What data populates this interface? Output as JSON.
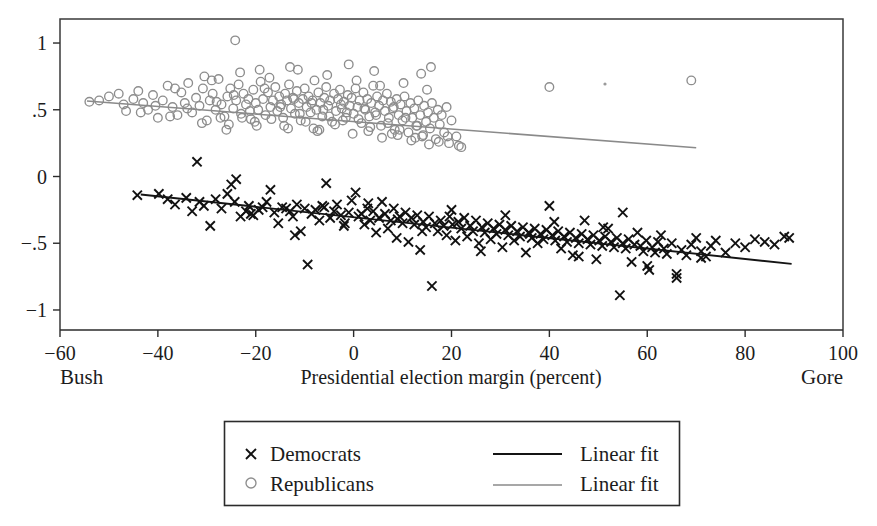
{
  "figure": {
    "background": "#ffffff",
    "plot_frame": {
      "left": 60,
      "top": 19,
      "right": 843,
      "bottom": 330
    }
  },
  "chart_data": {
    "type": "scatter",
    "title": "",
    "subtitle": "",
    "xlabel": "Presidential election margin (percent)",
    "ylabel": "",
    "xlim": [
      -60,
      100
    ],
    "ylim": [
      -1.15,
      1.18
    ],
    "xticks": [
      -60,
      -40,
      -20,
      0,
      20,
      40,
      60,
      80,
      100
    ],
    "xtick_labels": [
      "−60",
      "−40",
      "−20",
      "0",
      "20",
      "40",
      "60",
      "80",
      "100"
    ],
    "yticks": [
      -1,
      -0.5,
      0,
      0.5,
      1
    ],
    "ytick_labels": [
      "−1",
      "−.5",
      "0",
      ".5",
      "1"
    ],
    "grid": false,
    "legend_position": "below-center",
    "axis_end_labels": {
      "left": "Bush",
      "right": "Gore"
    },
    "series": [
      {
        "name": "Democrats",
        "marker": "x",
        "color": "#111111",
        "x": [
          -44.2,
          -39.8,
          -38.0,
          -36.5,
          -34.2,
          -33.0,
          -31.5,
          -30.6,
          -29.3,
          -28.2,
          -27.0,
          -25.8,
          -25.0,
          -24.3,
          -23.1,
          -22.0,
          -21.4,
          -20.5,
          -19.4,
          -18.6,
          -17.8,
          -17.0,
          -16.2,
          -15.4,
          -14.6,
          -13.8,
          -13.0,
          -12.4,
          -11.6,
          -10.8,
          -10.0,
          -9.4,
          -8.6,
          -7.8,
          -7.0,
          -6.4,
          -5.6,
          -4.8,
          -4.0,
          -3.4,
          -2.6,
          -1.8,
          -1.0,
          -0.4,
          0.4,
          1.0,
          1.6,
          2.2,
          2.8,
          3.4,
          4.0,
          4.6,
          5.2,
          5.8,
          6.4,
          7.0,
          7.6,
          8.2,
          8.8,
          9.4,
          10.0,
          10.6,
          11.2,
          11.8,
          12.4,
          13.0,
          13.6,
          14.2,
          14.8,
          15.4,
          16.0,
          16.6,
          17.2,
          17.8,
          18.4,
          19.0,
          19.6,
          20.2,
          20.8,
          21.4,
          22.0,
          22.6,
          23.2,
          23.8,
          24.4,
          25.0,
          25.6,
          26.2,
          26.8,
          27.4,
          28.0,
          28.6,
          29.2,
          29.8,
          30.4,
          31.0,
          31.6,
          32.2,
          32.8,
          33.4,
          34.0,
          34.6,
          35.2,
          35.8,
          36.4,
          37.0,
          37.6,
          38.2,
          38.8,
          39.4,
          40.0,
          40.6,
          41.2,
          41.8,
          42.4,
          43.0,
          43.6,
          44.2,
          44.8,
          45.4,
          46.0,
          46.6,
          47.2,
          47.8,
          48.4,
          49.0,
          49.6,
          50.2,
          50.8,
          51.4,
          52.0,
          52.6,
          53.2,
          53.8,
          54.4,
          55.0,
          55.6,
          56.2,
          56.8,
          57.4,
          58.0,
          58.6,
          59.2,
          59.8,
          60.4,
          61.0,
          61.6,
          62.2,
          62.8,
          63.4,
          64.0,
          65.0,
          66.0,
          67.0,
          68.0,
          69.0,
          70.0,
          71.0,
          72.0,
          73.0,
          74.0,
          76.0,
          78.0,
          80.0,
          82.0,
          84.0,
          86.0,
          88.0,
          89.0,
          -32.0,
          -24.0,
          -21.0,
          -12.0,
          -6.0,
          -2.0,
          3.0,
          9.0,
          14.0,
          20.0,
          26.0,
          31.0,
          36.0,
          41.0,
          46.0,
          51.0,
          55.0,
          60.0,
          66.0,
          71.0
        ],
        "y": [
          -0.14,
          -0.13,
          -0.17,
          -0.21,
          -0.16,
          -0.26,
          -0.19,
          -0.22,
          -0.37,
          -0.17,
          -0.24,
          -0.13,
          -0.06,
          -0.19,
          -0.3,
          -0.26,
          -0.22,
          -0.29,
          -0.25,
          -0.23,
          -0.19,
          -0.1,
          -0.27,
          -0.35,
          -0.23,
          -0.24,
          -0.26,
          -0.3,
          -0.21,
          -0.41,
          -0.24,
          -0.66,
          -0.28,
          -0.25,
          -0.33,
          -0.22,
          -0.05,
          -0.31,
          -0.26,
          -0.21,
          -0.29,
          -0.35,
          -0.27,
          -0.18,
          -0.12,
          -0.3,
          -0.28,
          -0.36,
          -0.24,
          -0.33,
          -0.26,
          -0.42,
          -0.31,
          -0.19,
          -0.28,
          -0.39,
          -0.33,
          -0.24,
          -0.46,
          -0.3,
          -0.35,
          -0.27,
          -0.49,
          -0.31,
          -0.36,
          -0.29,
          -0.55,
          -0.34,
          -0.38,
          -0.3,
          -0.82,
          -0.35,
          -0.41,
          -0.33,
          -0.37,
          -0.44,
          -0.3,
          -0.36,
          -0.48,
          -0.34,
          -0.39,
          -0.31,
          -0.45,
          -0.37,
          -0.41,
          -0.33,
          -0.5,
          -0.38,
          -0.42,
          -0.35,
          -0.47,
          -0.39,
          -0.43,
          -0.36,
          -0.53,
          -0.4,
          -0.44,
          -0.37,
          -0.48,
          -0.41,
          -0.45,
          -0.38,
          -0.57,
          -0.42,
          -0.46,
          -0.39,
          -0.5,
          -0.43,
          -0.47,
          -0.4,
          -0.22,
          -0.44,
          -0.48,
          -0.41,
          -0.54,
          -0.45,
          -0.49,
          -0.42,
          -0.59,
          -0.46,
          -0.5,
          -0.43,
          -0.33,
          -0.47,
          -0.51,
          -0.44,
          -0.62,
          -0.48,
          -0.52,
          -0.45,
          -0.39,
          -0.49,
          -0.53,
          -0.46,
          -0.89,
          -0.5,
          -0.54,
          -0.47,
          -0.64,
          -0.51,
          -0.42,
          -0.52,
          -0.56,
          -0.48,
          -0.7,
          -0.53,
          -0.57,
          -0.49,
          -0.44,
          -0.54,
          -0.58,
          -0.5,
          -0.76,
          -0.55,
          -0.59,
          -0.51,
          -0.46,
          -0.56,
          -0.6,
          -0.52,
          -0.48,
          -0.57,
          -0.5,
          -0.53,
          -0.47,
          -0.49,
          -0.51,
          -0.45,
          -0.46,
          0.11,
          -0.02,
          -0.28,
          -0.44,
          -0.23,
          -0.37,
          -0.2,
          -0.32,
          -0.41,
          -0.25,
          -0.56,
          -0.29,
          -0.43,
          -0.34,
          -0.6,
          -0.38,
          -0.27,
          -0.67,
          -0.73,
          -0.61
        ]
      },
      {
        "name": "Republicans",
        "marker": "o",
        "color": "#8d8d8d",
        "x": [
          -54.0,
          -52.0,
          -50.0,
          -48.0,
          -46.5,
          -45.0,
          -44.0,
          -43.0,
          -42.0,
          -41.0,
          -40.0,
          -39.0,
          -38.0,
          -37.0,
          -36.0,
          -35.2,
          -34.5,
          -33.8,
          -33.0,
          -32.2,
          -31.5,
          -30.8,
          -30.0,
          -29.4,
          -28.8,
          -28.2,
          -27.6,
          -27.0,
          -26.4,
          -25.8,
          -25.2,
          -24.6,
          -24.0,
          -23.5,
          -23.0,
          -22.5,
          -22.0,
          -21.5,
          -21.0,
          -20.5,
          -20.0,
          -19.5,
          -19.0,
          -18.5,
          -18.0,
          -17.5,
          -17.0,
          -16.5,
          -16.0,
          -15.6,
          -15.2,
          -14.8,
          -14.4,
          -14.0,
          -13.6,
          -13.2,
          -12.8,
          -12.4,
          -12.0,
          -11.6,
          -11.2,
          -10.8,
          -10.4,
          -10.0,
          -9.6,
          -9.2,
          -8.8,
          -8.4,
          -8.0,
          -7.6,
          -7.2,
          -6.8,
          -6.4,
          -6.0,
          -5.6,
          -5.2,
          -4.8,
          -4.4,
          -4.0,
          -3.6,
          -3.2,
          -2.8,
          -2.4,
          -2.0,
          -1.6,
          -1.2,
          -0.8,
          -0.4,
          0.0,
          0.4,
          0.8,
          1.2,
          1.6,
          2.0,
          2.4,
          2.8,
          3.2,
          3.6,
          4.0,
          4.4,
          4.8,
          5.2,
          5.6,
          6.0,
          6.4,
          6.8,
          7.2,
          7.6,
          8.0,
          8.4,
          8.8,
          9.2,
          9.6,
          10.0,
          10.4,
          10.8,
          11.2,
          11.6,
          12.0,
          12.4,
          12.8,
          13.2,
          13.6,
          14.0,
          14.4,
          14.8,
          15.2,
          15.6,
          16.0,
          16.4,
          16.8,
          17.2,
          17.6,
          18.0,
          18.5,
          19.0,
          19.5,
          20.0,
          21.0,
          22.0,
          -47.0,
          -43.5,
          -40.5,
          -37.5,
          -34.0,
          -31.0,
          -28.0,
          -26.0,
          -24.5,
          -22.8,
          -21.2,
          -19.8,
          -18.2,
          -16.8,
          -15.0,
          -13.4,
          -12.2,
          -11.0,
          -9.8,
          -8.6,
          -7.4,
          -6.2,
          -5.0,
          -3.8,
          -2.6,
          -1.4,
          -0.2,
          1.0,
          2.2,
          3.4,
          4.6,
          5.8,
          7.0,
          8.2,
          9.4,
          10.6,
          11.8,
          13.0,
          14.2,
          15.4,
          -30.5,
          -27.2,
          -23.2,
          -20.2,
          -17.2,
          -14.2,
          -11.4,
          -8.2,
          -5.4,
          -2.2,
          0.6,
          3.0,
          5.4,
          7.8,
          10.2,
          12.6,
          15.0,
          17.4,
          19.2,
          21.5,
          -36.5,
          -29.0,
          -25.5,
          -19.2,
          -13.0,
          -7.0,
          -1.0,
          4.2,
          9.0,
          13.8,
          -24.2,
          15.8,
          40.0,
          69.0
        ],
        "y": [
          0.56,
          0.57,
          0.6,
          0.62,
          0.49,
          0.58,
          0.64,
          0.55,
          0.5,
          0.61,
          0.44,
          0.57,
          0.68,
          0.52,
          0.46,
          0.63,
          0.55,
          0.7,
          0.48,
          0.59,
          0.53,
          0.66,
          0.42,
          0.57,
          0.62,
          0.5,
          0.73,
          0.54,
          0.45,
          0.6,
          0.66,
          0.51,
          0.57,
          0.69,
          0.47,
          0.62,
          0.54,
          0.58,
          0.43,
          0.65,
          0.55,
          0.5,
          0.71,
          0.58,
          0.46,
          0.63,
          0.52,
          0.57,
          0.67,
          0.49,
          0.6,
          0.54,
          0.44,
          0.62,
          0.57,
          0.69,
          0.51,
          0.59,
          0.47,
          0.64,
          0.55,
          0.42,
          0.58,
          0.66,
          0.52,
          0.6,
          0.48,
          0.57,
          0.72,
          0.5,
          0.63,
          0.55,
          0.45,
          0.59,
          0.67,
          0.53,
          0.57,
          0.41,
          0.62,
          0.49,
          0.58,
          0.65,
          0.51,
          0.56,
          0.44,
          0.61,
          0.53,
          0.59,
          0.47,
          0.66,
          0.52,
          0.57,
          0.4,
          0.63,
          0.5,
          0.58,
          0.45,
          0.55,
          0.68,
          0.48,
          0.6,
          0.53,
          0.38,
          0.57,
          0.49,
          0.62,
          0.44,
          0.56,
          0.51,
          0.35,
          0.58,
          0.46,
          0.54,
          0.42,
          0.6,
          0.49,
          0.33,
          0.55,
          0.44,
          0.51,
          0.38,
          0.57,
          0.46,
          0.3,
          0.53,
          0.41,
          0.48,
          0.36,
          0.55,
          0.44,
          0.28,
          0.5,
          0.39,
          0.46,
          0.33,
          0.52,
          0.25,
          0.42,
          0.3,
          0.22,
          0.54,
          0.48,
          0.53,
          0.45,
          0.51,
          0.4,
          0.56,
          0.35,
          0.61,
          0.44,
          0.49,
          0.38,
          0.66,
          0.43,
          0.52,
          0.36,
          0.58,
          0.47,
          0.41,
          0.55,
          0.34,
          0.5,
          0.45,
          0.39,
          0.54,
          0.48,
          0.32,
          0.43,
          0.51,
          0.37,
          0.46,
          0.29,
          0.4,
          0.52,
          0.35,
          0.44,
          0.27,
          0.38,
          0.31,
          0.24,
          0.75,
          0.44,
          0.78,
          0.41,
          0.74,
          0.38,
          0.8,
          0.36,
          0.76,
          0.42,
          0.72,
          0.34,
          0.68,
          0.32,
          0.7,
          0.29,
          0.65,
          0.26,
          0.3,
          0.23,
          0.66,
          0.72,
          0.39,
          0.8,
          0.82,
          0.35,
          0.84,
          0.79,
          0.31,
          0.77,
          1.02,
          0.82,
          0.67,
          0.72
        ]
      }
    ],
    "fits": [
      {
        "name": "Linear fit",
        "for": "Democrats",
        "color": "#141414",
        "x0": -43.5,
        "y0": -0.135,
        "x1": 89.5,
        "y1": -0.655
      },
      {
        "name": "Linear fit",
        "for": "Republicans",
        "color": "#8a8a8a",
        "x0": -54.5,
        "y0": 0.565,
        "x1": 70.0,
        "y1": 0.215
      }
    ],
    "legend": {
      "entries": [
        {
          "symbol": "x",
          "label": "Democrats",
          "color": "#111111"
        },
        {
          "symbol": "o",
          "label": "Republicans",
          "color": "#8d8d8d"
        },
        {
          "symbol": "line",
          "label": "Linear fit",
          "color": "#141414"
        },
        {
          "symbol": "line",
          "label": "Linear fit",
          "color": "#8a8a8a"
        }
      ]
    }
  }
}
